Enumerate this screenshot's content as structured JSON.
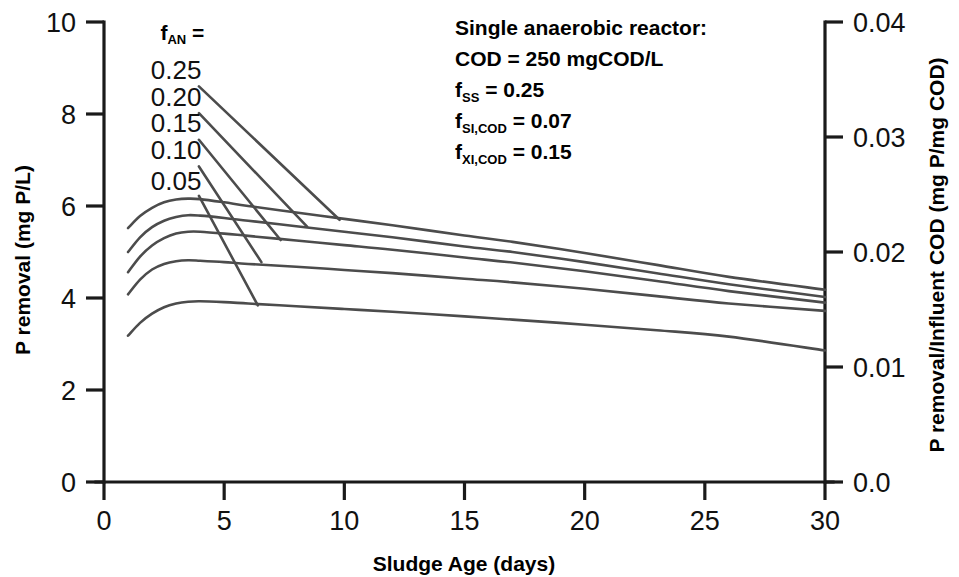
{
  "chart_data": {
    "type": "line",
    "title": "",
    "xlabel": "Sludge Age (days)",
    "ylabel": "P removal (mg P/L)",
    "y2label": "P removal/Influent COD (mg P/mg COD)",
    "xlim": [
      0,
      30
    ],
    "ylim": [
      0,
      10
    ],
    "y2lim": [
      0.0,
      0.04
    ],
    "grid": false,
    "legend_position": "inside-upper-left",
    "xticks": [
      "0",
      "5",
      "10",
      "15",
      "20",
      "25",
      "30"
    ],
    "xtick_values": [
      0,
      5,
      10,
      15,
      20,
      25,
      30
    ],
    "yticks": [
      "0",
      "2",
      "4",
      "6",
      "8",
      "10"
    ],
    "ytick_values": [
      0,
      2,
      4,
      6,
      8,
      10
    ],
    "y2ticks": [
      "0.0",
      "0.01",
      "0.02",
      "0.03",
      "0.04"
    ],
    "y2tick_values": [
      0.0,
      0.01,
      0.02,
      0.03,
      0.04
    ],
    "legend_header": "f",
    "legend_header_sub": "AN",
    "legend_header_eq": " =",
    "series": [
      {
        "name": "0.25",
        "label": "0.25",
        "label_x": 3.0,
        "label_y": 8.95,
        "leader": [
          [
            3.95,
            8.6
          ],
          [
            9.8,
            5.7
          ]
        ],
        "x": [
          1.0,
          1.5,
          2.0,
          2.5,
          3.0,
          3.5,
          4.0,
          5.0,
          6.0,
          8.0,
          10.0,
          12.0,
          15.0,
          17.0,
          20.0,
          23.0,
          26.0,
          30.0
        ],
        "values": [
          5.52,
          5.78,
          5.96,
          6.08,
          6.14,
          6.16,
          6.15,
          6.08,
          6.0,
          5.86,
          5.72,
          5.58,
          5.36,
          5.22,
          4.98,
          4.72,
          4.46,
          4.18
        ]
      },
      {
        "name": "0.20",
        "label": "0.20",
        "label_x": 3.0,
        "label_y": 8.38,
        "leader": [
          [
            3.95,
            8.02
          ],
          [
            8.45,
            5.55
          ]
        ],
        "x": [
          1.0,
          1.5,
          2.0,
          2.5,
          3.0,
          3.5,
          4.0,
          5.0,
          6.0,
          8.0,
          10.0,
          12.0,
          15.0,
          17.0,
          20.0,
          23.0,
          26.0,
          30.0
        ],
        "values": [
          5.0,
          5.32,
          5.54,
          5.68,
          5.76,
          5.8,
          5.79,
          5.74,
          5.68,
          5.56,
          5.44,
          5.32,
          5.12,
          5.0,
          4.78,
          4.54,
          4.3,
          4.02
        ]
      },
      {
        "name": "0.15",
        "label": "0.15",
        "label_x": 3.0,
        "label_y": 7.8,
        "leader": [
          [
            3.95,
            7.44
          ],
          [
            7.35,
            5.26
          ]
        ],
        "x": [
          1.0,
          1.5,
          2.0,
          2.5,
          3.0,
          3.5,
          4.0,
          5.0,
          6.0,
          8.0,
          10.0,
          12.0,
          15.0,
          17.0,
          20.0,
          23.0,
          26.0,
          30.0
        ],
        "values": [
          4.56,
          4.9,
          5.14,
          5.3,
          5.4,
          5.44,
          5.44,
          5.4,
          5.35,
          5.25,
          5.15,
          5.05,
          4.88,
          4.77,
          4.58,
          4.37,
          4.15,
          3.9
        ]
      },
      {
        "name": "0.10",
        "label": "0.10",
        "label_x": 3.0,
        "label_y": 7.22,
        "leader": [
          [
            3.95,
            6.86
          ],
          [
            6.55,
            4.78
          ]
        ],
        "x": [
          1.0,
          1.5,
          2.0,
          2.5,
          3.0,
          3.5,
          4.0,
          5.0,
          6.0,
          8.0,
          10.0,
          12.0,
          15.0,
          17.0,
          20.0,
          23.0,
          26.0,
          30.0
        ],
        "values": [
          4.08,
          4.4,
          4.62,
          4.74,
          4.8,
          4.82,
          4.81,
          4.78,
          4.74,
          4.68,
          4.61,
          4.54,
          4.42,
          4.34,
          4.2,
          4.04,
          3.88,
          3.72
        ]
      },
      {
        "name": "0.05",
        "label": "0.05",
        "label_x": 3.0,
        "label_y": 6.55,
        "leader": [
          [
            3.95,
            6.22
          ],
          [
            6.4,
            3.84
          ]
        ],
        "x": [
          1.0,
          1.5,
          2.0,
          2.5,
          3.0,
          3.5,
          4.0,
          5.0,
          6.0,
          8.0,
          10.0,
          12.0,
          15.0,
          17.0,
          20.0,
          23.0,
          26.0,
          30.0
        ],
        "values": [
          3.18,
          3.46,
          3.66,
          3.8,
          3.88,
          3.92,
          3.93,
          3.91,
          3.88,
          3.82,
          3.76,
          3.7,
          3.6,
          3.53,
          3.42,
          3.3,
          3.16,
          2.86
        ]
      }
    ],
    "annotation": {
      "lines": [
        {
          "text": "Single anaerobic reactor:",
          "sub": "",
          "sub2": "",
          "rest": ""
        },
        {
          "text": "COD = 250 mgCOD/L",
          "sub": "",
          "sub2": "",
          "rest": ""
        },
        {
          "text": "f",
          "sub": "SS",
          "rest": " = 0.25"
        },
        {
          "text": "f",
          "sub": "SI,COD",
          "rest": " = 0.07"
        },
        {
          "text": "f",
          "sub": "XI,COD",
          "rest": " = 0.15"
        }
      ]
    }
  },
  "colors": {
    "curve": "#4c4c4c",
    "axis": "#1a1a1a",
    "text": "#000000",
    "background": "#ffffff"
  }
}
